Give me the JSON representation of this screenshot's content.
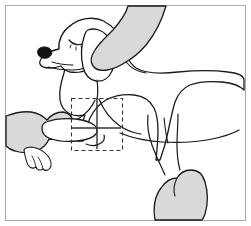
{
  "figure": {
    "title": "Line drawing of a dog being examined by two hands",
    "caption": "",
    "width": 251,
    "height": 226,
    "background_color": "#ffffff",
    "frame": {
      "name": "figure-border",
      "stroke_color": "#a9a9a9",
      "stroke_width": 1,
      "x": 5,
      "y": 5,
      "width": 241,
      "height": 216
    },
    "colors": {
      "outline": "#1a1a1a",
      "hand_fill": "#d9d9d9",
      "dog_fill": "#ffffff",
      "nose_fill": "#111111",
      "callout_stroke": "#333333",
      "background": "#ffffff"
    },
    "subjects": [
      {
        "name": "dog-body",
        "label": "Dog",
        "fill": "#ffffff",
        "stroke": "#1a1a1a",
        "description": "Side view of a dog standing, head at upper left, body extending to the right"
      },
      {
        "name": "dog-head",
        "label": "Dog head",
        "description": "Head with closed eye, black nose and long floppy ear"
      },
      {
        "name": "dog-eye-closed",
        "label": "Closed eye",
        "description": "Curved arc indicating a relaxed closed eye"
      },
      {
        "name": "dog-nose",
        "label": "Nose",
        "fill": "#111111"
      },
      {
        "name": "dog-ear",
        "label": "Floppy ear",
        "fill": "#ffffff"
      },
      {
        "name": "hand-upper",
        "label": "Examiner hand on shoulder",
        "fill": "#d9d9d9",
        "position": "top-right",
        "description": "Forearm and hand entering from top of frame resting on the dog's neck and shoulder"
      },
      {
        "name": "hand-left",
        "label": "Examiner hand lifting foreleg",
        "fill": "#d9d9d9",
        "position": "left",
        "description": "Forearm and hand entering from left of frame supporting the dog's foreleg"
      },
      {
        "name": "hand-lower",
        "label": "Examiner hand on hind leg",
        "fill": "#d9d9d9",
        "position": "bottom-right",
        "description": "Hand entering from bottom of frame grasping the dog's hind leg"
      }
    ],
    "callout": {
      "name": "region-of-interest",
      "label": "",
      "style": "dashed-rectangle",
      "stroke_color": "#333333",
      "dash_pattern": "4 3",
      "x": 71,
      "y": 98,
      "width": 51,
      "height": 52,
      "markers": [
        {
          "name": "callout-vertical-axis",
          "orientation": "vertical",
          "x": 97,
          "y1": 98,
          "y2": 149
        },
        {
          "name": "callout-horizontal-axis",
          "orientation": "horizontal",
          "y": 128,
          "x1": 72,
          "x2": 121
        }
      ]
    }
  }
}
